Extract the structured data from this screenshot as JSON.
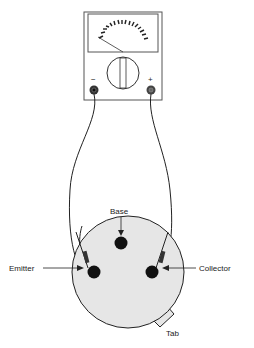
{
  "diagram": {
    "meter": {
      "name": "analog-multimeter",
      "terminals": [
        {
          "id": "negative",
          "label": "−"
        },
        {
          "id": "positive",
          "label": "+"
        }
      ]
    },
    "transistor": {
      "pins": [
        {
          "id": "base",
          "label": "Base"
        },
        {
          "id": "emitter",
          "label": "Emitter"
        },
        {
          "id": "collector",
          "label": "Collector"
        }
      ],
      "tab_label": "Tab"
    },
    "colors": {
      "line": "#222222",
      "body_fill": "#e6e6e6",
      "background": "#ffffff"
    }
  }
}
